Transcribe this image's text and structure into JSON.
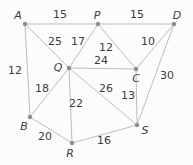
{
  "diagram": {
    "type": "weighted-undirected-graph",
    "canvas": {
      "width": 193,
      "height": 165
    },
    "colors": {
      "background": "#fcfcfc",
      "edge": "#bdbdbd",
      "node": "#8f8f8f",
      "text": "#3c3c3c"
    },
    "nodes": [
      {
        "id": "A",
        "x": 25,
        "y": 24,
        "label": "A",
        "label_x": 18,
        "label_y": 19
      },
      {
        "id": "P",
        "x": 98,
        "y": 24,
        "label": "P",
        "label_x": 97,
        "label_y": 19
      },
      {
        "id": "D",
        "x": 174,
        "y": 24,
        "label": "D",
        "label_x": 177,
        "label_y": 19
      },
      {
        "id": "Q",
        "x": 69,
        "y": 68,
        "label": "Q",
        "label_x": 58,
        "label_y": 71
      },
      {
        "id": "C",
        "x": 136,
        "y": 69,
        "label": "C",
        "label_x": 136,
        "label_y": 82
      },
      {
        "id": "B",
        "x": 30,
        "y": 117,
        "label": "B",
        "label_x": 24,
        "label_y": 130
      },
      {
        "id": "R",
        "x": 72,
        "y": 143,
        "label": "R",
        "label_x": 70,
        "label_y": 157
      },
      {
        "id": "S",
        "x": 137,
        "y": 125,
        "label": "S",
        "label_x": 145,
        "label_y": 134
      }
    ],
    "edges": [
      {
        "from": "A",
        "to": "P",
        "weight": "15",
        "label_x": 60,
        "label_y": 18
      },
      {
        "from": "P",
        "to": "D",
        "weight": "15",
        "label_x": 137,
        "label_y": 18
      },
      {
        "from": "A",
        "to": "B",
        "weight": "12",
        "label_x": 15,
        "label_y": 74
      },
      {
        "from": "A",
        "to": "Q",
        "weight": "25",
        "label_x": 55,
        "label_y": 45
      },
      {
        "from": "P",
        "to": "Q",
        "weight": "17",
        "label_x": 78,
        "label_y": 45
      },
      {
        "from": "P",
        "to": "C",
        "weight": "12",
        "label_x": 106,
        "label_y": 51
      },
      {
        "from": "D",
        "to": "C",
        "weight": "10",
        "label_x": 148,
        "label_y": 45
      },
      {
        "from": "Q",
        "to": "C",
        "weight": "24",
        "label_x": 101,
        "label_y": 64
      },
      {
        "from": "D",
        "to": "S",
        "weight": "30",
        "label_x": 167,
        "label_y": 79
      },
      {
        "from": "Q",
        "to": "B",
        "weight": "18",
        "label_x": 42,
        "label_y": 92
      },
      {
        "from": "Q",
        "to": "S",
        "weight": "26",
        "label_x": 106,
        "label_y": 92
      },
      {
        "from": "C",
        "to": "S",
        "weight": "13",
        "label_x": 128,
        "label_y": 99
      },
      {
        "from": "Q",
        "to": "R",
        "weight": "22",
        "label_x": 76,
        "label_y": 107
      },
      {
        "from": "B",
        "to": "R",
        "weight": "20",
        "label_x": 45,
        "label_y": 140
      },
      {
        "from": "R",
        "to": "S",
        "weight": "16",
        "label_x": 104,
        "label_y": 144
      }
    ]
  }
}
